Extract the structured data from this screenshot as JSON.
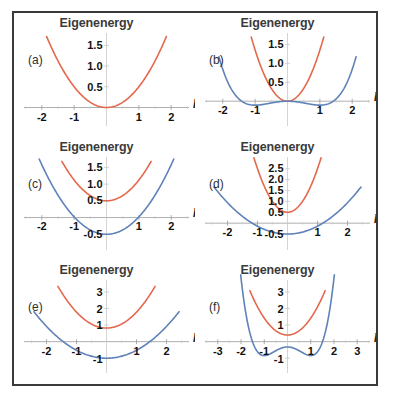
{
  "figure": {
    "border_color": "#3a3a3a",
    "background": "#ffffff",
    "upper_band_color": "#e4694c",
    "lower_band_color": "#5f82b8",
    "axis_color": "#9a9a9a",
    "grid_tick_color": "#c9c9c9"
  },
  "chart_data": [
    {
      "id": "a",
      "type": "line",
      "panel_label": "(a)",
      "title": "Eigenenergy",
      "xlabel": "k_x",
      "ylabel": "Eigenenergy",
      "xlim": [
        -2.55,
        2.55
      ],
      "ylim": [
        -0.35,
        1.75
      ],
      "xticks": [
        -2,
        -1,
        1,
        2
      ],
      "xtick_labels": [
        "-2",
        "-1",
        "1",
        "2"
      ],
      "yticks": [
        0.5,
        1.0,
        1.5
      ],
      "ytick_labels": [
        "0.5",
        "1.0",
        "1.5"
      ],
      "grid": false,
      "legend": "none",
      "series": [
        {
          "name": "upper band",
          "color": "#e4694c",
          "form": "parabola",
          "a": 0.5,
          "x0": 0.0,
          "y0": 0.0,
          "xrange": [
            -1.85,
            1.85
          ]
        }
      ]
    },
    {
      "id": "b",
      "type": "line",
      "panel_label": "(b)",
      "title": "Eigenenergy",
      "xlabel": "k_x",
      "ylabel": "Eigenenergy",
      "xlim": [
        -2.55,
        2.55
      ],
      "ylim": [
        -0.55,
        1.75
      ],
      "xticks": [
        -2,
        -1,
        1,
        2
      ],
      "xtick_labels": [
        "-2",
        "-1",
        "1",
        "2"
      ],
      "yticks": [
        0.5,
        1.0,
        1.5
      ],
      "ytick_labels": [
        "0.5",
        "1.0",
        "1.5"
      ],
      "grid": false,
      "legend": "none",
      "series": [
        {
          "name": "upper band",
          "color": "#e4694c",
          "form": "parabola",
          "a": 1.35,
          "x0": 0.0,
          "y0": 0.0,
          "xrange": [
            -1.12,
            1.12
          ]
        },
        {
          "name": "lower band",
          "color": "#5f82b8",
          "form": "double-well",
          "a": 0.105,
          "w": 1.0,
          "y0": 0.0,
          "xrange": [
            -2.12,
            2.12
          ]
        }
      ]
    },
    {
      "id": "c",
      "type": "line",
      "panel_label": "(c)",
      "title": "Eigenenergy",
      "xlabel": "k_x",
      "ylabel": "Eigenenergy",
      "xlim": [
        -2.55,
        2.55
      ],
      "ylim": [
        -0.85,
        1.75
      ],
      "xticks": [
        -2,
        -1,
        1,
        2
      ],
      "xtick_labels": [
        "-2",
        "-1",
        "1",
        "2"
      ],
      "yticks": [
        -0.5,
        0.5,
        1.0,
        1.5
      ],
      "ytick_labels": [
        "-0.5",
        "0.5",
        "1.0",
        "1.5"
      ],
      "grid": false,
      "legend": "none",
      "series": [
        {
          "name": "upper band",
          "color": "#e4694c",
          "form": "parabola",
          "a": 0.62,
          "x0": 0.0,
          "y0": 0.5,
          "xrange": [
            -1.38,
            1.38
          ]
        },
        {
          "name": "lower band",
          "color": "#5f82b8",
          "form": "parabola",
          "a": 0.52,
          "x0": 0.0,
          "y0": -0.5,
          "xrange": [
            -2.08,
            2.08
          ]
        }
      ]
    },
    {
      "id": "d",
      "type": "line",
      "panel_label": "(d)",
      "title": "Eigenenergy",
      "xlabel": "k_x",
      "ylabel": "Eigenenergy",
      "xlim": [
        -2.75,
        2.75
      ],
      "ylim": [
        -1.05,
        2.95
      ],
      "xticks": [
        -2,
        -1,
        1,
        2
      ],
      "xtick_labels": [
        "-2",
        "-1",
        "1",
        "2"
      ],
      "yticks": [
        -0.5,
        0.5,
        1.0,
        1.5,
        2.0,
        2.5
      ],
      "ytick_labels": [
        "-0.5",
        "0.5",
        "1.0",
        "1.5",
        "2.0",
        "2.5"
      ],
      "grid": false,
      "legend": "none",
      "series": [
        {
          "name": "upper band",
          "color": "#e4694c",
          "form": "parabola",
          "a": 2.0,
          "x0": 0.0,
          "y0": 0.5,
          "xrange": [
            -1.12,
            1.12
          ]
        },
        {
          "name": "lower band",
          "color": "#5f82b8",
          "form": "parabola",
          "a": 0.36,
          "x0": 0.0,
          "y0": -0.5,
          "xrange": [
            -2.45,
            2.45
          ]
        }
      ]
    },
    {
      "id": "e",
      "type": "line",
      "panel_label": "(e)",
      "title": "Eigenenergy",
      "xlabel": "k_x",
      "ylabel": "Eigenenergy",
      "xlim": [
        -2.75,
        2.75
      ],
      "ylim": [
        -1.65,
        3.6
      ],
      "xticks": [
        -2,
        -1,
        1,
        2
      ],
      "xtick_labels": [
        "-2",
        "-1",
        "1",
        "2"
      ],
      "yticks": [
        -1,
        1,
        2,
        3
      ],
      "ytick_labels": [
        "-1",
        "1",
        "2",
        "3"
      ],
      "grid": false,
      "legend": "none",
      "series": [
        {
          "name": "upper band",
          "color": "#e4694c",
          "form": "parabola",
          "a": 0.96,
          "x0": 0.0,
          "y0": 0.82,
          "xrange": [
            -1.62,
            1.62
          ]
        },
        {
          "name": "lower band",
          "color": "#5f82b8",
          "form": "parabola",
          "a": 0.48,
          "x0": 0.0,
          "y0": -1.0,
          "xrange": [
            -2.42,
            2.42
          ]
        }
      ]
    },
    {
      "id": "f",
      "type": "line",
      "panel_label": "(f)",
      "title": "Eigenenergy",
      "xlabel": "k_x",
      "ylabel": "Eigenenergy",
      "xlim": [
        -3.55,
        3.55
      ],
      "ylim": [
        -1.65,
        3.6
      ],
      "xticks": [
        -3,
        -2,
        -1,
        1,
        2,
        3
      ],
      "xtick_labels": [
        "-3",
        "-2",
        "-1",
        "1",
        "2",
        "3"
      ],
      "yticks": [
        -1,
        1,
        2,
        3
      ],
      "ytick_labels": [
        "-1",
        "1",
        "2",
        "3"
      ],
      "grid": false,
      "legend": "none",
      "series": [
        {
          "name": "upper band",
          "color": "#e4694c",
          "form": "parabola",
          "a": 1.02,
          "x0": 0.0,
          "y0": 0.4,
          "xrange": [
            -1.62,
            1.62
          ]
        },
        {
          "name": "lower band",
          "color": "#5f82b8",
          "form": "double-well",
          "a": 0.52,
          "w": 1.0,
          "y0": -0.32,
          "xrange": [
            -3.1,
            3.1
          ]
        }
      ]
    }
  ]
}
